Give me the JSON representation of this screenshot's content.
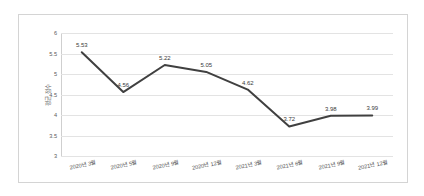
{
  "chart_data": {
    "type": "line",
    "title": "",
    "xlabel": "",
    "ylabel": "평균 점수",
    "ylim": [
      3,
      6
    ],
    "ytick_step": 0.5,
    "yticks": [
      "6",
      "5.5",
      "5",
      "4.5",
      "4",
      "3.5",
      "3"
    ],
    "grid": true,
    "legend": "none",
    "categories": [
      "2020년 3월",
      "2020년 5월",
      "2020년 9월",
      "2020년 12월",
      "2021년 3월",
      "2021년 6월",
      "2021년 9월",
      "2021년 12월"
    ],
    "values": [
      5.53,
      4.56,
      5.22,
      5.05,
      4.62,
      3.72,
      3.98,
      3.99
    ],
    "data_labels": [
      "5.53",
      "4.56",
      "5.22",
      "5.05",
      "4.62",
      "3.72",
      "3.98",
      "3.99"
    ],
    "series": [
      {
        "name": "평균 점수",
        "values": [
          5.53,
          4.56,
          5.22,
          5.05,
          4.62,
          3.72,
          3.98,
          3.99
        ]
      }
    ],
    "colors": {
      "line": "#404040",
      "gridline": "#e3e3e3",
      "axis": "#cfcfcf",
      "border": "#d4d4d4",
      "tick_text": "#5a5a5a",
      "label_text": "#3a3a3a",
      "background": "#ffffff"
    }
  }
}
